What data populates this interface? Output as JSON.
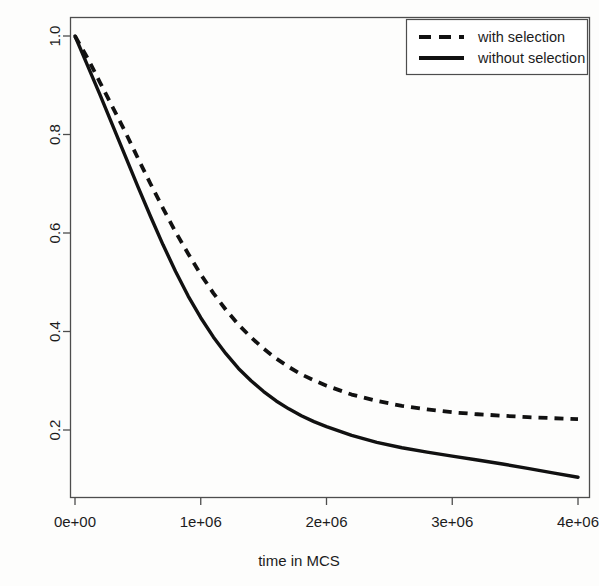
{
  "chart_data": {
    "type": "line",
    "title": "",
    "subtitle": "",
    "xlabel": "time in MCS",
    "ylabel": "",
    "xlim": [
      0,
      4000000
    ],
    "ylim": [
      0.08,
      1.03
    ],
    "grid": false,
    "legend_position": "top-right",
    "xticks": [
      0,
      1000000,
      2000000,
      3000000,
      4000000
    ],
    "xticklabels": [
      "0e+00",
      "1e+06",
      "2e+06",
      "3e+06",
      "4e+06"
    ],
    "yticks": [
      0.2,
      0.4,
      0.6,
      0.8,
      1.0
    ],
    "yticklabels": [
      "0.2",
      "0.4",
      "0.6",
      "0.8",
      "1.0"
    ],
    "x": [
      0,
      100000,
      200000,
      300000,
      400000,
      500000,
      600000,
      700000,
      800000,
      900000,
      1000000,
      1100000,
      1200000,
      1300000,
      1400000,
      1500000,
      1600000,
      1700000,
      1800000,
      1900000,
      2000000,
      2200000,
      2400000,
      2600000,
      2800000,
      3000000,
      3200000,
      3400000,
      3600000,
      3800000,
      4000000
    ],
    "series": [
      {
        "name": "with selection",
        "style": "dashed",
        "color": "#111111",
        "values": [
          1.0,
          0.955,
          0.905,
          0.855,
          0.805,
          0.752,
          0.7,
          0.65,
          0.602,
          0.558,
          0.516,
          0.478,
          0.444,
          0.414,
          0.388,
          0.365,
          0.345,
          0.328,
          0.313,
          0.301,
          0.29,
          0.272,
          0.259,
          0.249,
          0.242,
          0.236,
          0.232,
          0.229,
          0.226,
          0.224,
          0.222
        ]
      },
      {
        "name": "without selection",
        "style": "solid",
        "color": "#111111",
        "values": [
          1.0,
          0.94,
          0.88,
          0.818,
          0.756,
          0.694,
          0.634,
          0.576,
          0.522,
          0.472,
          0.428,
          0.389,
          0.355,
          0.325,
          0.3,
          0.278,
          0.259,
          0.243,
          0.229,
          0.217,
          0.207,
          0.189,
          0.175,
          0.164,
          0.155,
          0.147,
          0.139,
          0.131,
          0.122,
          0.113,
          0.104
        ]
      }
    ]
  },
  "legend": {
    "entries": [
      {
        "label": "with selection",
        "style": "dashed"
      },
      {
        "label": "without selection",
        "style": "solid"
      }
    ]
  },
  "axes": {
    "x_title": "time in MCS",
    "y_title": ""
  }
}
